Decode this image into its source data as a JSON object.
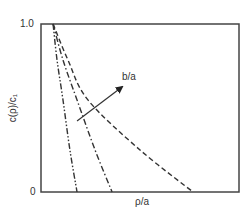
{
  "chart_data": {
    "type": "line",
    "title": "",
    "xlabel": "ρ/a",
    "ylabel": "c(ρ)/c₁",
    "y_tick_labels": [
      "0",
      "1.0"
    ],
    "x_tick_labels": [],
    "ylim": [
      0,
      1.0
    ],
    "xlim": [
      0,
      1
    ],
    "grid": false,
    "legend": null,
    "annotations": [
      {
        "text": "b/a",
        "type": "arrow",
        "meaning": "increasing b/a",
        "from": [
          0.182,
          0.423
        ],
        "to": [
          0.409,
          0.625
        ]
      }
    ],
    "series": [
      {
        "name": "curve-1 (smallest b/a)",
        "style": "dash-dot-dot",
        "x": [
          0.061,
          0.081,
          0.111,
          0.146,
          0.182
        ],
        "y": [
          1.0,
          0.786,
          0.548,
          0.25,
          0.0
        ]
      },
      {
        "name": "curve-2",
        "style": "dash-dot",
        "x": [
          0.061,
          0.111,
          0.182,
          0.273,
          0.359
        ],
        "y": [
          1.0,
          0.786,
          0.548,
          0.25,
          0.0
        ]
      },
      {
        "name": "curve-3 (largest b/a)",
        "style": "dashed",
        "x": [
          0.061,
          0.136,
          0.237,
          0.5,
          0.768
        ],
        "y": [
          1.0,
          0.786,
          0.548,
          0.25,
          0.0
        ]
      }
    ]
  },
  "labels": {
    "ytick_top": "1.0",
    "ytick_bottom": "0",
    "xlabel": "ρ/a",
    "ylabel": "c(ρ)/c₁",
    "annotation": "b/a"
  },
  "colors": {
    "frame": "#444444",
    "curves": "#333333",
    "text": "#333333"
  }
}
